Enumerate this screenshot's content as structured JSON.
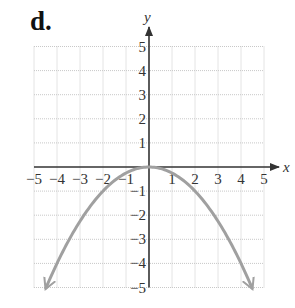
{
  "panel_label": "d.",
  "chart_data": {
    "type": "line",
    "title": "",
    "xlabel": "x",
    "ylabel": "y",
    "xlim": [
      -5,
      5
    ],
    "ylim": [
      -5,
      5
    ],
    "grid": true,
    "x_ticks": [
      -5,
      -4,
      -3,
      -2,
      -1,
      1,
      2,
      3,
      4,
      5
    ],
    "y_ticks": [
      -5,
      -4,
      -3,
      -2,
      -1,
      1,
      2,
      3,
      4,
      5
    ],
    "x_tick_labels": [
      "−5",
      "−4",
      "−3",
      "−2",
      "−1",
      "1",
      "2",
      "3",
      "4",
      "5"
    ],
    "y_tick_labels": [
      "5",
      "4",
      "3",
      "2",
      "1",
      "−1",
      "−2",
      "−3",
      "−4",
      "−5"
    ],
    "series": [
      {
        "name": "y = -x^2/4",
        "equation": "y = -x^2/4",
        "color": "#a0a0a0",
        "arrows_at_ends": true,
        "x": [
          -4.5,
          -4,
          -3,
          -2,
          -1,
          0,
          1,
          2,
          3,
          4,
          4.5
        ],
        "y": [
          -5.06,
          -4,
          -2.25,
          -1,
          -0.25,
          0,
          -0.25,
          -1,
          -2.25,
          -4,
          -5.06
        ]
      }
    ],
    "colors": {
      "axis": "#333333",
      "grid": "#c8c8c8",
      "curve": "#a0a0a0"
    }
  }
}
